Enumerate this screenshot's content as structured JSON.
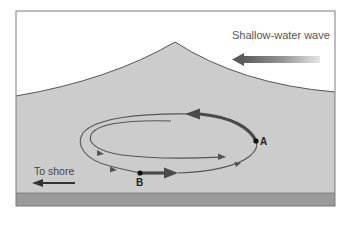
{
  "diagram": {
    "title_label": "Shallow-water wave",
    "shore_label": "To shore",
    "point_a": "A",
    "point_b": "B",
    "colors": {
      "air": "#ffffff",
      "water": "#cccccc",
      "seabed": "#9a9a9a",
      "frame": "#7a7a7a",
      "orbit_line": "#555555"
    }
  }
}
